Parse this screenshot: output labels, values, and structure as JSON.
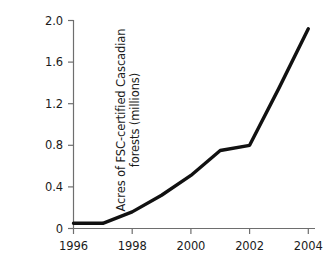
{
  "chart_data": {
    "type": "line",
    "title": "",
    "xlabel": "",
    "ylabel": "Acres of FSC-certified Cascadian forests (millions)",
    "ylabel_lines": [
      "Acres of FSC-certified Cascadian",
      "forests (millions)"
    ],
    "x": [
      1996,
      1997,
      1998,
      1999,
      2000,
      2001,
      2002,
      2003,
      2004
    ],
    "values": [
      0.05,
      0.05,
      0.16,
      0.32,
      0.51,
      0.75,
      0.8,
      1.35,
      1.92
    ],
    "series": [
      {
        "name": "FSC-certified Cascadian forests",
        "values": [
          0.05,
          0.05,
          0.16,
          0.32,
          0.51,
          0.75,
          0.8,
          1.35,
          1.92
        ]
      }
    ],
    "xlim": [
      1996,
      2004
    ],
    "ylim": [
      0,
      2.0
    ],
    "xticks": [
      1996,
      1998,
      2000,
      2002,
      2004
    ],
    "xtick_labels": [
      "1996",
      "1998",
      "2000",
      "2002",
      "2004"
    ],
    "yticks": [
      0,
      0.4,
      0.8,
      1.2,
      1.6,
      2.0
    ],
    "ytick_labels": [
      "0",
      "0.4",
      "0.8",
      "1.2",
      "1.6",
      "2.0"
    ],
    "grid": false,
    "legend": "none",
    "line_color": "#111111",
    "axis_color": "#6e6e6e",
    "background_color": "#ffffff"
  }
}
